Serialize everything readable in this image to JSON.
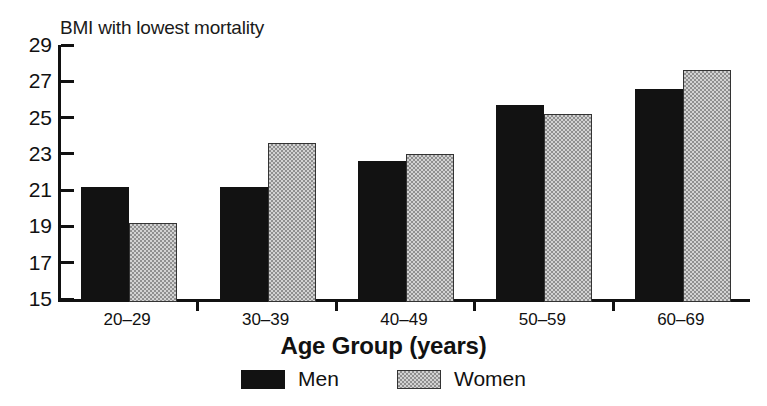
{
  "chart_data": {
    "type": "bar",
    "title": "BMI with lowest mortality",
    "xlabel": "Age Group (years)",
    "ylabel": "",
    "categories": [
      "20–29",
      "30–39",
      "40–49",
      "50–59",
      "60–69"
    ],
    "series": [
      {
        "name": "Men",
        "color": "#121212",
        "values": [
          21.2,
          21.2,
          22.6,
          25.7,
          26.6
        ]
      },
      {
        "name": "Women",
        "color": "#d2d2d2",
        "values": [
          19.2,
          23.6,
          23.0,
          25.2,
          27.6
        ]
      }
    ],
    "ylim": [
      15,
      29
    ],
    "yticks": [
      15,
      17,
      19,
      21,
      23,
      25,
      27,
      29
    ],
    "ytick_labels": [
      "15",
      "17",
      "19",
      "21",
      "23",
      "25",
      "27",
      "29"
    ],
    "grid": false,
    "legend_position": "bottom-center"
  },
  "legend": {
    "entries": [
      {
        "label": "Men"
      },
      {
        "label": "Women"
      }
    ]
  },
  "colors": {
    "men_fill": "#121212",
    "women_fill": "#d2d2d2",
    "axis": "#111111",
    "background": "#ffffff"
  }
}
